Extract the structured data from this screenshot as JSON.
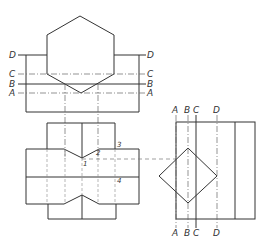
{
  "figure": {
    "type": "orthographic projection drawing",
    "views": [
      "top-view",
      "front-view",
      "side-view"
    ]
  },
  "top_view": {
    "section_labels_left": [
      "D",
      "C",
      "B",
      "A"
    ],
    "section_labels_right": [
      "D",
      "C",
      "B",
      "A"
    ]
  },
  "front_view": {
    "point_labels": [
      "1",
      "2",
      "3",
      "4"
    ]
  },
  "side_view": {
    "section_labels_top": [
      "A",
      "B",
      "C",
      "D"
    ],
    "section_labels_bottom": [
      "A",
      "B",
      "C",
      "D"
    ]
  },
  "colors": {
    "line": "#333333",
    "background": "#ffffff"
  }
}
